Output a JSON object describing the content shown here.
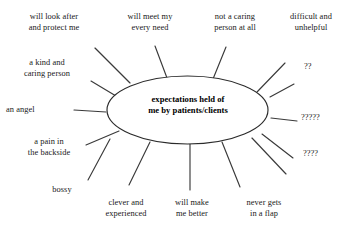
{
  "diagram": {
    "type": "spider-radial-diagram",
    "center": {
      "label": "expectations held of\nme by patients/clients",
      "shape": "ellipse",
      "cx": 187.5,
      "cy": 110,
      "rx": 80.5,
      "ry": 34,
      "stroke_color": "#2b2b2b",
      "fill_color": "#ffffff"
    },
    "line_color": "#3a3a3a",
    "background_color": "#ffffff",
    "spokes": [
      {
        "id": "will-look-after-and-protect-me",
        "label": "will look after\nand protect me",
        "x1": 130,
        "y1": 83,
        "x2": 95,
        "y2": 48,
        "label_x": 8,
        "label_y": 12,
        "label_w": 92,
        "align": "c"
      },
      {
        "id": "will-meet-my-every-need",
        "label": "will meet my\nevery need",
        "x1": 167,
        "y1": 78,
        "x2": 155,
        "y2": 46,
        "label_x": 108,
        "label_y": 12,
        "label_w": 84,
        "align": "c"
      },
      {
        "id": "not-a-caring-person-at-all",
        "label": "not a caring\nperson at all",
        "x1": 213,
        "y1": 79,
        "x2": 226,
        "y2": 47,
        "label_x": 194,
        "label_y": 12,
        "label_w": 82,
        "align": "c"
      },
      {
        "id": "difficult-and-unhelpful",
        "label": "difficult and\nunhelpful",
        "x1": 257,
        "y1": 92,
        "x2": 285,
        "y2": 63,
        "label_x": 272,
        "label_y": 12,
        "label_w": 78,
        "align": "c"
      },
      {
        "id": "a-kind-and-caring-person",
        "label": "a kind and\ncaring person",
        "x1": 116,
        "y1": 96,
        "x2": 91,
        "y2": 81,
        "label_x": 6,
        "label_y": 58,
        "label_w": 82,
        "align": "c"
      },
      {
        "id": "question-marks-2",
        "label": "??",
        "x1": 270,
        "y1": 97,
        "x2": 294,
        "y2": 84,
        "label_x": 304,
        "label_y": 62,
        "label_w": 38,
        "align": "l"
      },
      {
        "id": "an-angel",
        "label": "an angel",
        "x1": 106,
        "y1": 112,
        "x2": 74,
        "y2": 110,
        "label_x": 6,
        "label_y": 105,
        "label_w": 60,
        "align": "l"
      },
      {
        "id": "question-marks-5",
        "label": "?????",
        "x1": 271,
        "y1": 118,
        "x2": 297,
        "y2": 121,
        "label_x": 301,
        "label_y": 113,
        "label_w": 46,
        "align": "l"
      },
      {
        "id": "a-pain-in-the-backside",
        "label": "a pain in\nthe backside",
        "x1": 119,
        "y1": 131,
        "x2": 86,
        "y2": 145,
        "label_x": 8,
        "label_y": 137,
        "label_w": 82,
        "align": "c"
      },
      {
        "id": "question-marks-4",
        "label": "????",
        "x1": 262,
        "y1": 134,
        "x2": 293,
        "y2": 158,
        "label_x": 303,
        "label_y": 149,
        "label_w": 42,
        "align": "l"
      },
      {
        "id": "bossy",
        "label": "bossy",
        "x1": 110,
        "y1": 139,
        "x2": 88,
        "y2": 180,
        "label_x": 38,
        "label_y": 185,
        "label_w": 48,
        "align": "c"
      },
      {
        "id": "clever-and-experienced",
        "label": "clever and\nexperienced",
        "x1": 150,
        "y1": 142,
        "x2": 129,
        "y2": 185,
        "label_x": 84,
        "label_y": 198,
        "label_w": 84,
        "align": "c"
      },
      {
        "id": "will-make-me-better",
        "label": "will make\nme better",
        "x1": 190,
        "y1": 144,
        "x2": 190,
        "y2": 190,
        "label_x": 158,
        "label_y": 198,
        "label_w": 68,
        "align": "c"
      },
      {
        "id": "never-gets-in-a-flap",
        "label": "never gets\nin a flap",
        "x1": 222,
        "y1": 142,
        "x2": 240,
        "y2": 187,
        "label_x": 228,
        "label_y": 198,
        "label_w": 72,
        "align": "c"
      },
      {
        "id": "spoke-lower-right-extra",
        "label": "",
        "x1": 252,
        "y1": 138,
        "x2": 286,
        "y2": 174,
        "label_x": 0,
        "label_y": 0,
        "label_w": 0,
        "align": "c"
      }
    ]
  }
}
